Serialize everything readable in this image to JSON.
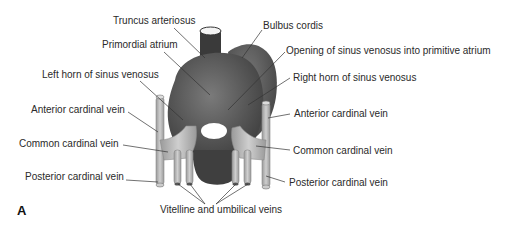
{
  "figure": {
    "panel_letter": "A",
    "labels": {
      "truncus_arteriosus": "Truncus arteriosus",
      "bulbus_cordis": "Bulbus cordis",
      "primordial_atrium": "Primordial atrium",
      "opening_sinus_venosus": "Opening of sinus venosus into primitive atrium",
      "left_horn": "Left horn of sinus venosus",
      "right_horn": "Right horn of sinus venosus",
      "anterior_cardinal_left": "Anterior cardinal vein",
      "anterior_cardinal_right": "Anterior cardinal vein",
      "common_cardinal_left": "Common cardinal vein",
      "common_cardinal_right": "Common cardinal vein",
      "posterior_cardinal_left": "Posterior cardinal vein",
      "posterior_cardinal_right": "Posterior cardinal vein",
      "vitelline_umbilical": "Vitelline and umbilical veins"
    },
    "colors": {
      "heart_dark": "#4a4a4a",
      "heart_mid": "#6e6e6e",
      "vein_light": "#b9b9b9",
      "opening": "#ffffff",
      "leader_line": "#333333"
    }
  }
}
